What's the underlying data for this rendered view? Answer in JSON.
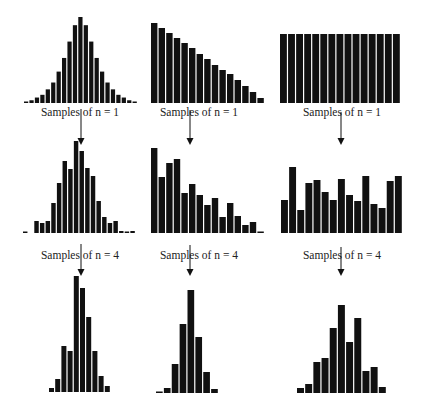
{
  "chart_data": [
    {
      "type": "bar",
      "row": 0,
      "col": 0,
      "title": "Population distribution (normal)",
      "x_range": [
        24,
        138
      ],
      "baseline_px": 103,
      "values": [
        1,
        2,
        4,
        6,
        10,
        15,
        23,
        33,
        45,
        57,
        63,
        57,
        45,
        33,
        23,
        15,
        10,
        6,
        4,
        2,
        1
      ],
      "max_value": 63,
      "top_px": 17
    },
    {
      "type": "bar",
      "row": 0,
      "col": 1,
      "title": "Population distribution (skewed)",
      "x_range": [
        151,
        265
      ],
      "baseline_px": 103,
      "values": [
        80,
        75,
        70,
        65,
        60,
        55,
        49,
        44,
        38,
        33,
        29,
        23,
        17,
        11,
        5
      ],
      "max_value": 80,
      "top_px": 23
    },
    {
      "type": "bar",
      "row": 0,
      "col": 2,
      "title": "Population distribution (uniform)",
      "x_range": [
        280,
        401
      ],
      "baseline_px": 103,
      "values": [
        69,
        69,
        69,
        69,
        69,
        69,
        69,
        69,
        69,
        69,
        69,
        69,
        69,
        69,
        69
      ],
      "max_value": 69,
      "top_px": 34
    },
    {
      "type": "bar",
      "row": 1,
      "col": 0,
      "title": "Samples of n = 1 (normal)",
      "x_range": [
        23,
        136
      ],
      "baseline_px": 233,
      "values": [
        1,
        0,
        12,
        10,
        12,
        30,
        50,
        72,
        64,
        92,
        82,
        65,
        57,
        32,
        16,
        10,
        12,
        2,
        1,
        2
      ],
      "max_value": 92,
      "top_px": 141
    },
    {
      "type": "bar",
      "row": 1,
      "col": 1,
      "title": "Samples of n = 1 (skewed)",
      "x_range": [
        151,
        265
      ],
      "baseline_px": 233,
      "values": [
        85,
        56,
        70,
        74,
        40,
        49,
        38,
        28,
        35,
        16,
        30,
        17,
        8,
        11,
        1
      ],
      "max_value": 85,
      "top_px": 148
    },
    {
      "type": "bar",
      "row": 1,
      "col": 2,
      "title": "Samples of n = 1 (uniform)",
      "x_range": [
        281,
        403
      ],
      "baseline_px": 233,
      "values": [
        33,
        66,
        23,
        50,
        53,
        41,
        33,
        54,
        38,
        32,
        57,
        29,
        25,
        52,
        57
      ],
      "max_value": 66,
      "top_px": 167
    },
    {
      "type": "bar",
      "row": 2,
      "col": 0,
      "title": "Samples of n = 4 (normal)",
      "x_range": [
        49,
        111
      ],
      "baseline_px": 392,
      "values": [
        4,
        13,
        46,
        41,
        116,
        104,
        75,
        41,
        16,
        6
      ],
      "max_value": 116,
      "top_px": 276
    },
    {
      "type": "bar",
      "row": 2,
      "col": 1,
      "title": "Samples of n = 4 (skewed)",
      "x_range": [
        156,
        219
      ],
      "baseline_px": 393,
      "values": [
        1,
        5,
        29,
        69,
        103,
        56,
        21,
        4
      ],
      "max_value": 103,
      "top_px": 290
    },
    {
      "type": "bar",
      "row": 2,
      "col": 2,
      "title": "Samples of n = 4 (uniform)",
      "x_range": [
        297,
        387
      ],
      "baseline_px": 393,
      "values": [
        5,
        9,
        31,
        35,
        65,
        88,
        51,
        75,
        22,
        26,
        6
      ],
      "max_value": 88,
      "top_px": 305
    }
  ],
  "labels": [
    {
      "text": "Samples of n = 1",
      "cx": 80,
      "y": 116,
      "arrow_x": 81,
      "arrow_top": 109,
      "arrow_bottom": 145
    },
    {
      "text": "Samples of n = 1",
      "cx": 199,
      "y": 116,
      "arrow_x": 190,
      "arrow_top": 110,
      "arrow_bottom": 145
    },
    {
      "text": "Samples of n = 1",
      "cx": 342,
      "y": 116,
      "arrow_x": 341,
      "arrow_top": 112,
      "arrow_bottom": 145
    },
    {
      "text": "Samples of n = 4",
      "cx": 80,
      "y": 259,
      "arrow_x": 81,
      "arrow_top": 244,
      "arrow_bottom": 276
    },
    {
      "text": "Samples of n = 4",
      "cx": 199,
      "y": 259,
      "arrow_x": 190,
      "arrow_top": 245,
      "arrow_bottom": 276
    },
    {
      "text": "Samples of n = 4",
      "cx": 342,
      "y": 259,
      "arrow_x": 341,
      "arrow_top": 247,
      "arrow_bottom": 276
    }
  ],
  "colors": {
    "bar": "#111111",
    "background": "#ffffff",
    "text": "#222222",
    "arrow": "#111111"
  }
}
